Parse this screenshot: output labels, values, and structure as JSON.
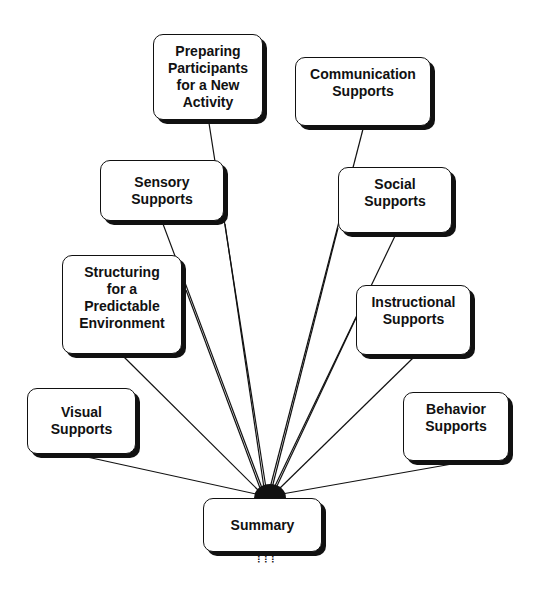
{
  "diagram": {
    "type": "hub-and-spoke concept map",
    "hub": {
      "label": "Summary"
    },
    "nodes": [
      {
        "id": "preparing",
        "label": "Preparing\nParticipants\nfor a New\nActivity"
      },
      {
        "id": "communication",
        "label": "Communication\nSupports"
      },
      {
        "id": "sensory",
        "label": "Sensory\nSupports"
      },
      {
        "id": "social",
        "label": "Social\nSupports"
      },
      {
        "id": "structuring",
        "label": "Structuring\nfor a\nPredictable\nEnvironment"
      },
      {
        "id": "instructional",
        "label": "Instructional\nSupports"
      },
      {
        "id": "visual",
        "label": "Visual\nSupports"
      },
      {
        "id": "behavior",
        "label": "Behavior\nSupports"
      }
    ],
    "edges": [
      [
        "preparing",
        "summary"
      ],
      [
        "communication",
        "summary"
      ],
      [
        "sensory",
        "summary"
      ],
      [
        "social",
        "summary"
      ],
      [
        "structuring",
        "summary"
      ],
      [
        "instructional",
        "summary"
      ],
      [
        "visual",
        "summary"
      ],
      [
        "behavior",
        "summary"
      ]
    ],
    "colors": {
      "line": "#111111",
      "box_fill": "#ffffff",
      "shadow": "#111111"
    }
  }
}
